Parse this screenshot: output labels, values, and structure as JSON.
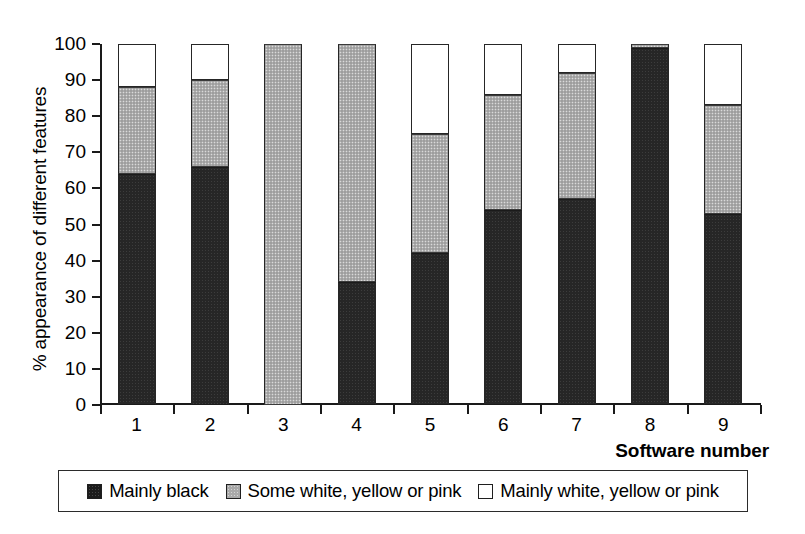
{
  "chart_data": {
    "type": "bar",
    "subtype": "stacked-bar-100-percent",
    "title": "",
    "xlabel": "Software number",
    "ylabel": "% appearance of different features",
    "categories": [
      "1",
      "2",
      "3",
      "4",
      "5",
      "6",
      "7",
      "8",
      "9"
    ],
    "ylim": [
      0,
      100
    ],
    "yticks": [
      0,
      10,
      20,
      30,
      40,
      50,
      60,
      70,
      80,
      90,
      100
    ],
    "ytick_labels": [
      "0",
      "10",
      "20",
      "30",
      "40",
      "50",
      "60",
      "70",
      "80",
      "90",
      "100"
    ],
    "grid": false,
    "legend_position": "bottom",
    "series": [
      {
        "name": "Mainly black",
        "color": "#262626",
        "values": [
          64,
          66,
          0,
          34,
          42,
          54,
          57,
          99,
          53
        ]
      },
      {
        "name": "Some white, yellow or pink",
        "color": "#aeaeae",
        "values": [
          24,
          24,
          100,
          66,
          33,
          32,
          35,
          1,
          30
        ]
      },
      {
        "name": "Mainly white, yellow or pink",
        "color": "#ffffff",
        "values": [
          12,
          10,
          0,
          0,
          25,
          14,
          8,
          0,
          17
        ]
      }
    ],
    "cumulative_tops": {
      "black": [
        64,
        66,
        0,
        34,
        42,
        54,
        57,
        99,
        53
      ],
      "black_plus_gray": [
        88,
        90,
        100,
        100,
        75,
        86,
        92,
        100,
        83
      ]
    },
    "legend": [
      {
        "label": "Mainly black",
        "swatch": "black-swatch"
      },
      {
        "label": "Some white, yellow or pink",
        "swatch": "gray-swatch"
      },
      {
        "label": "Mainly white, yellow or pink",
        "swatch": "white-swatch"
      }
    ]
  }
}
